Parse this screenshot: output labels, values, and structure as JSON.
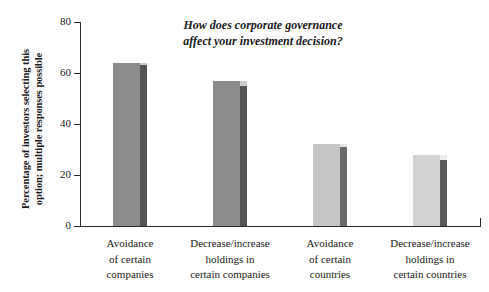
{
  "chart_data": {
    "type": "bar",
    "title": "How does corporate governance\naffect your investment decision?",
    "xlabel": "",
    "ylabel": "Percentage of investors selecting this\noption; multiple responses possible",
    "ylim": [
      0,
      80
    ],
    "yticks": [
      0,
      20,
      40,
      60,
      80
    ],
    "ytick_labels": [
      "0",
      "20",
      "40",
      "60",
      "80"
    ],
    "grid": false,
    "legend": "none",
    "categories": [
      "Avoidance\nof certain\ncompanies",
      "Decrease/increase\nholdings in\ncertain companies",
      "Avoidance\nof certain\ncountries",
      "Decrease/increase\nholdings in\ncertain countries"
    ],
    "values": [
      64,
      57,
      32,
      28
    ],
    "bars": [
      {
        "category": "Avoidance of certain companies",
        "value": 64,
        "side_value": 63,
        "face_color": "#8c8c8c",
        "side_color": "#555555"
      },
      {
        "category": "Decrease/increase holdings in certain companies",
        "value": 57,
        "side_value": 55,
        "face_color": "#8c8c8c",
        "side_color": "#555555"
      },
      {
        "category": "Avoidance of certain countries",
        "value": 32,
        "side_value": 31,
        "face_color": "#c6c6c6",
        "side_color": "#6a6a6a"
      },
      {
        "category": "Decrease/increase holdings in certain countries",
        "value": 28,
        "side_value": 26,
        "face_color": "#d2d2d2",
        "side_color": "#5a5a5a"
      }
    ],
    "axis_color": "#2b2b2b"
  }
}
